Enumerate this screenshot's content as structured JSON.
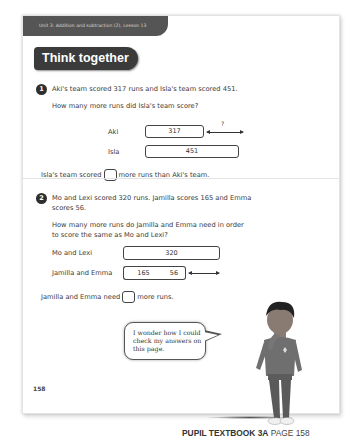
{
  "header": {
    "unit_label": "Unit 3: Addition and subtraction (2), Lesson 13",
    "title": "Think together"
  },
  "question1": {
    "number": "1",
    "statement": "Aki's team scored 317 runs and Isla's team scored 451.",
    "prompt": "How many more runs did Isla's team score?",
    "bar_model": {
      "rows": [
        {
          "label": "Aki",
          "value": "317"
        },
        {
          "label": "Isla",
          "value": "451"
        }
      ],
      "difference_label": "?"
    },
    "answer_sentence_before": "Isla's team scored",
    "answer_sentence_after": "more runs than Aki's team."
  },
  "question2": {
    "number": "2",
    "statement_line1": "Mo and Lexi scored 320 runs. Jamilla scores 165 and Emma",
    "statement_line2": "scores 56.",
    "prompt_line1": "How many more runs do Jamilla and Emma need in order",
    "prompt_line2": "to score the same as Mo and Lexi?",
    "bar_model": {
      "rows": [
        {
          "label": "Mo and Lexi",
          "value": "320"
        },
        {
          "label": "Jamilla and Emma",
          "values": [
            "165",
            "56"
          ]
        }
      ]
    },
    "answer_sentence_before": "Jamilla and Emma need",
    "answer_sentence_after": "more runs."
  },
  "speech_bubble": {
    "line1": "I wonder how I could",
    "line2": "check my answers on",
    "line3": "this page."
  },
  "page_number": "158",
  "footer": {
    "book": "PUPIL TEXTBOOK 3A",
    "page": "PAGE 158"
  }
}
